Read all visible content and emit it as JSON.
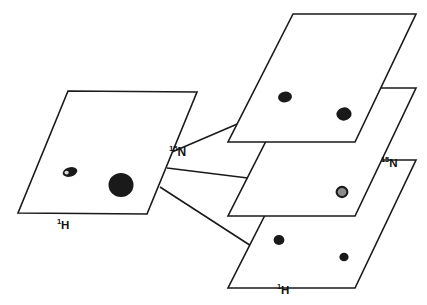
{
  "figure": {
    "canvas": {
      "width": 427,
      "height": 305
    },
    "style": {
      "background": "#ffffff",
      "stroke": "#1a1a1a",
      "stroke_width": 1.6,
      "peak_fill": "#1a1a1a",
      "peak_ring_fill": "#8c8c8c"
    }
  },
  "labels": {
    "left_plane_h": {
      "sup": "1",
      "base": "H"
    },
    "left_plane_n": {
      "sup": "15",
      "base": "N"
    },
    "right_stack_n": {
      "sup": "15",
      "base": "N"
    },
    "right_stack_h": {
      "sup": "1",
      "base": "H"
    }
  },
  "planes": {
    "left": {
      "name": "2D projection plane",
      "points": "68,91 197,92 147,214 18,213",
      "peaks": [
        {
          "name": "small-blob-peak",
          "cx": 70,
          "cy": 172,
          "rx": 7.5,
          "ry": 4.6,
          "rot": -16,
          "kind": "blob",
          "fill": "#1a1a1a"
        },
        {
          "name": "large-round-peak",
          "cx": 121,
          "cy": 185,
          "rx": 12.5,
          "ry": 12,
          "rot": 0,
          "kind": "solid",
          "fill": "#1a1a1a"
        }
      ],
      "blob_highlight": {
        "cx": 66.6,
        "cy": 172.6,
        "rx": 2.1,
        "ry": 1.9,
        "fill": "#d8d8d8"
      }
    },
    "stack": [
      {
        "name": "top-slice-plane",
        "points": "293,14 416,14 355,142 228,142",
        "peaks": [
          {
            "name": "peak-a",
            "cx": 285,
            "cy": 97,
            "rx": 7.0,
            "ry": 5.4,
            "rot": -8,
            "fill": "#1a1a1a"
          },
          {
            "name": "peak-b",
            "cx": 344,
            "cy": 114,
            "rx": 7.6,
            "ry": 6.6,
            "rot": -8,
            "fill": "#1a1a1a"
          }
        ]
      },
      {
        "name": "middle-slice-plane",
        "points": "293,88 416,88 355,216 228,216",
        "peaks": [
          {
            "name": "peak-ring",
            "cx": 342,
            "cy": 192,
            "rx": 5.4,
            "ry": 5.1,
            "rot": 0,
            "kind": "ring",
            "fill": "#1a1a1a",
            "inner_fill": "#8c8c8c"
          }
        ]
      },
      {
        "name": "bottom-slice-plane",
        "points": "293,160 416,160 355,288 228,288",
        "peaks": [
          {
            "name": "peak-c",
            "cx": 279,
            "cy": 240,
            "rx": 5.4,
            "ry": 5.0,
            "rot": 0,
            "fill": "#1a1a1a"
          },
          {
            "name": "peak-d",
            "cx": 344,
            "cy": 257,
            "rx": 4.6,
            "ry": 4.3,
            "rot": 0,
            "fill": "#1a1a1a"
          }
        ]
      }
    ],
    "connectors": [
      {
        "name": "connector-to-top-slice",
        "x1": 172,
        "y1": 152,
        "x2": 277,
        "y2": 107
      },
      {
        "name": "connector-to-middle-slice",
        "x1": 167,
        "y1": 168,
        "x2": 272,
        "y2": 181
      },
      {
        "name": "connector-to-bottom-slice",
        "x1": 160,
        "y1": 187,
        "x2": 262,
        "y2": 253
      }
    ]
  }
}
